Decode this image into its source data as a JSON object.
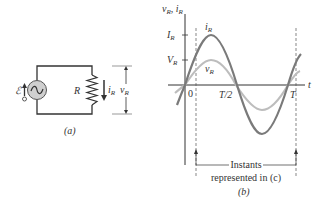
{
  "figure_a": {
    "caption": "(a)",
    "source_label": "ℰ",
    "resistor_label": "R",
    "current_label": "i",
    "current_sub": "R",
    "voltage_label": "v",
    "voltage_sub": "R"
  },
  "figure_b": {
    "caption": "(b)",
    "y_axis_label": "v",
    "y_axis_sub1": "R",
    "y_axis_sep": ", i",
    "y_axis_sub2": "R",
    "x_axis_label": "t",
    "tick_IR": "I",
    "tick_IR_sub": "R",
    "tick_VR": "V",
    "tick_VR_sub": "R",
    "time_0": "0",
    "time_half": "T/2",
    "time_T": "T",
    "curve_i_label": "i",
    "curve_i_sub": "R",
    "curve_v_label": "v",
    "curve_v_sub": "R",
    "annotation_line1": "Instants",
    "annotation_line2": "represented in (c)",
    "colors": {
      "current": "#7a7a7a",
      "voltage": "#bdbdbd",
      "axes": "#333333"
    }
  }
}
